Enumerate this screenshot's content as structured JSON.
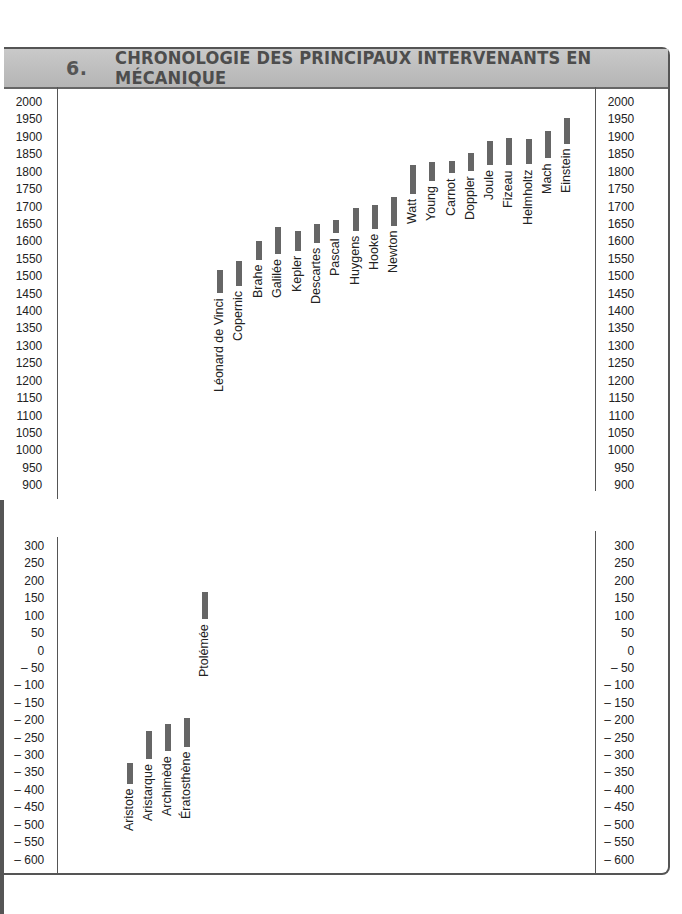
{
  "header": {
    "number": "6.",
    "title": "CHRONOLOGIE DES PRINCIPAUX INTERVENANTS EN MÉCANIQUE"
  },
  "chart_data": [
    {
      "type": "bar",
      "orientation": "floating-vertical (lifespan ranges)",
      "title": "Chronologie des principaux intervenants en mécanique — période moderne",
      "ylim": [
        900,
        2000
      ],
      "yticks": [
        2000,
        1950,
        1900,
        1850,
        1800,
        1750,
        1700,
        1650,
        1600,
        1550,
        1500,
        1450,
        1400,
        1350,
        1300,
        1250,
        1200,
        1150,
        1100,
        1050,
        1000,
        950,
        900
      ],
      "categories": [
        "Léonard de Vinci",
        "Copernic",
        "Brahe",
        "Galilée",
        "Kepler",
        "Descartes",
        "Pascal",
        "Huygens",
        "Hooke",
        "Newton",
        "Watt",
        "Young",
        "Carnot",
        "Doppler",
        "Joule",
        "Fizeau",
        "Helmholtz",
        "Mach",
        "Einstein"
      ],
      "series": [
        {
          "name": "naissance",
          "values": [
            1452,
            1473,
            1546,
            1564,
            1571,
            1596,
            1623,
            1629,
            1635,
            1643,
            1736,
            1773,
            1796,
            1803,
            1818,
            1819,
            1821,
            1838,
            1879
          ]
        },
        {
          "name": "décès",
          "values": [
            1519,
            1543,
            1601,
            1642,
            1630,
            1650,
            1662,
            1695,
            1703,
            1727,
            1819,
            1829,
            1832,
            1853,
            1889,
            1896,
            1894,
            1916,
            1955
          ]
        }
      ],
      "grid": false,
      "axes": "left and right"
    },
    {
      "type": "bar",
      "orientation": "floating-vertical (lifespan ranges)",
      "title": "Chronologie des principaux intervenants en mécanique — Antiquité",
      "ylim": [
        -600,
        300
      ],
      "yticks": [
        300,
        250,
        200,
        150,
        100,
        50,
        0,
        -50,
        -100,
        -150,
        -200,
        -250,
        -300,
        -350,
        -400,
        -450,
        -500,
        -550,
        -600
      ],
      "categories": [
        "Aristote",
        "Aristarque",
        "Archimède",
        "Ératosthène",
        "Ptolémée"
      ],
      "series": [
        {
          "name": "naissance",
          "values": [
            -384,
            -310,
            -287,
            -276,
            90
          ]
        },
        {
          "name": "décès",
          "values": [
            -322,
            -230,
            -212,
            -194,
            168
          ]
        }
      ],
      "grid": false,
      "axes": "left and right"
    }
  ],
  "upper": {
    "ticks": [
      "2000",
      "1950",
      "1900",
      "1850",
      "1800",
      "1750",
      "1700",
      "1650",
      "1600",
      "1550",
      "1500",
      "1450",
      "1400",
      "1350",
      "1300",
      "1250",
      "1200",
      "1150",
      "1100",
      "1050",
      "1000",
      "950",
      "900"
    ],
    "people": [
      {
        "name": "Léonard de Vinci",
        "x": 217,
        "y0": 1452,
        "y1": 1519
      },
      {
        "name": "Copernic",
        "x": 236,
        "y0": 1473,
        "y1": 1543
      },
      {
        "name": "Brahe",
        "x": 256,
        "y0": 1546,
        "y1": 1601
      },
      {
        "name": "Galilée",
        "x": 275,
        "y0": 1564,
        "y1": 1642
      },
      {
        "name": "Kepler",
        "x": 295,
        "y0": 1571,
        "y1": 1630
      },
      {
        "name": "Descartes",
        "x": 314,
        "y0": 1596,
        "y1": 1650
      },
      {
        "name": "Pascal",
        "x": 333,
        "y0": 1623,
        "y1": 1662
      },
      {
        "name": "Huygens",
        "x": 353,
        "y0": 1629,
        "y1": 1695
      },
      {
        "name": "Hooke",
        "x": 372,
        "y0": 1635,
        "y1": 1703
      },
      {
        "name": "Newton",
        "x": 391,
        "y0": 1643,
        "y1": 1727
      },
      {
        "name": "Watt",
        "x": 410,
        "y0": 1736,
        "y1": 1819
      },
      {
        "name": "Young",
        "x": 429,
        "y0": 1773,
        "y1": 1829
      },
      {
        "name": "Carnot",
        "x": 449,
        "y0": 1796,
        "y1": 1832
      },
      {
        "name": "Doppler",
        "x": 468,
        "y0": 1803,
        "y1": 1853
      },
      {
        "name": "Joule",
        "x": 487,
        "y0": 1818,
        "y1": 1889
      },
      {
        "name": "Fizeau",
        "x": 506,
        "y0": 1819,
        "y1": 1896
      },
      {
        "name": "Helmholtz",
        "x": 526,
        "y0": 1821,
        "y1": 1894
      },
      {
        "name": "Mach",
        "x": 545,
        "y0": 1838,
        "y1": 1916
      },
      {
        "name": "Einstein",
        "x": 564,
        "y0": 1879,
        "y1": 1955
      }
    ]
  },
  "lower": {
    "ticks": [
      "300",
      "250",
      "200",
      "150",
      "100",
      "50",
      "0",
      "– 50",
      "– 100",
      "– 150",
      "– 200",
      "– 250",
      "– 300",
      "– 350",
      "– 400",
      "– 450",
      "– 500",
      "– 550",
      "– 600"
    ],
    "people": [
      {
        "name": "Aristote",
        "x": 127,
        "y0": -384,
        "y1": -322
      },
      {
        "name": "Aristarque",
        "x": 146,
        "y0": -310,
        "y1": -230
      },
      {
        "name": "Archimède",
        "x": 165,
        "y0": -287,
        "y1": -212
      },
      {
        "name": "Ératosthène",
        "x": 184,
        "y0": -276,
        "y1": -194
      },
      {
        "name": "Ptolémée",
        "x": 202,
        "y0": 90,
        "y1": 168
      }
    ]
  },
  "colors": {
    "bar": "#666666",
    "header_bg": "#bdbdbd",
    "frame": "#555555"
  }
}
